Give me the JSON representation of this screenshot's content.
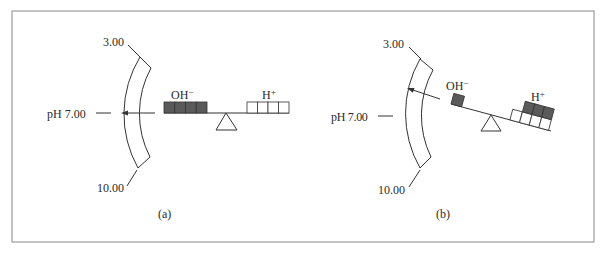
{
  "figure": {
    "frame_color": "#9a9a9a",
    "dark_fill": "#5a5a5a",
    "line_color": "#333333"
  },
  "panels": [
    {
      "id": "a",
      "caption": "(a)",
      "scale": {
        "top_label": "3.00",
        "middle_label": "pH 7.00",
        "bottom_label": "10.00"
      },
      "oh_label": "OH",
      "oh_sup": "−",
      "h_label": "H",
      "h_sup": "+",
      "oh_count": 4,
      "h_count": 4,
      "state": "balanced"
    },
    {
      "id": "b",
      "caption": "(b)",
      "scale": {
        "top_label": "3.00",
        "middle_label": "pH 7.00",
        "bottom_label": "10.00"
      },
      "oh_label": "OH",
      "oh_sup": "−",
      "h_label": "H",
      "h_sup": "+",
      "oh_count": 1,
      "h_count": 7,
      "state": "tilted toward H+"
    }
  ]
}
